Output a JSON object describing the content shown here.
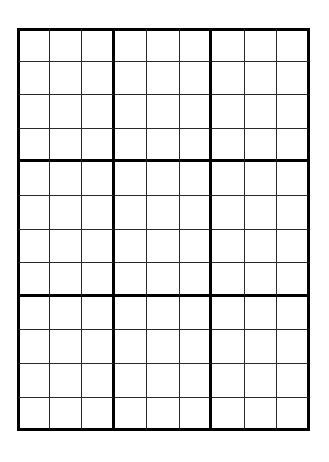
{
  "page": {
    "background_color": "#ffffff",
    "width": 329,
    "height": 462
  },
  "grid": {
    "name": "blank-grid",
    "columns": 9,
    "rows": 12,
    "block_columns": 3,
    "block_rows": 4,
    "cell_width": 32.5,
    "cell_height": 33.6,
    "origin_x": 17,
    "origin_y": 28,
    "thin_line_color": "#2a2a2a",
    "thin_line_width": 1.5,
    "thick_line_color": "#000000",
    "thick_line_width": 3,
    "cell_fill": "#ffffff",
    "cell_values": [
      [
        "",
        "",
        "",
        "",
        "",
        "",
        "",
        "",
        ""
      ],
      [
        "",
        "",
        "",
        "",
        "",
        "",
        "",
        "",
        ""
      ],
      [
        "",
        "",
        "",
        "",
        "",
        "",
        "",
        "",
        ""
      ],
      [
        "",
        "",
        "",
        "",
        "",
        "",
        "",
        "",
        ""
      ],
      [
        "",
        "",
        "",
        "",
        "",
        "",
        "",
        "",
        ""
      ],
      [
        "",
        "",
        "",
        "",
        "",
        "",
        "",
        "",
        ""
      ],
      [
        "",
        "",
        "",
        "",
        "",
        "",
        "",
        "",
        ""
      ],
      [
        "",
        "",
        "",
        "",
        "",
        "",
        "",
        "",
        ""
      ],
      [
        "",
        "",
        "",
        "",
        "",
        "",
        "",
        "",
        ""
      ],
      [
        "",
        "",
        "",
        "",
        "",
        "",
        "",
        "",
        ""
      ],
      [
        "",
        "",
        "",
        "",
        "",
        "",
        "",
        "",
        ""
      ],
      [
        "",
        "",
        "",
        "",
        "",
        "",
        "",
        "",
        ""
      ]
    ]
  }
}
